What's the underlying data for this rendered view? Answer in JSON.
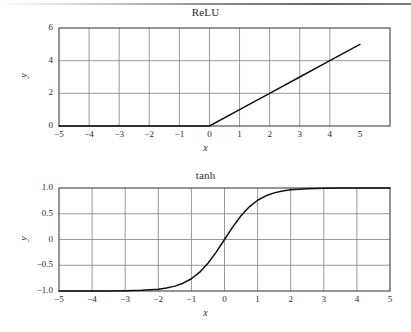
{
  "page": {
    "background_color": "#ffffff",
    "ink_color": "#1a1a1a",
    "grid_color": "#808080",
    "axis_color": "#404040",
    "curve_color": "#111111"
  },
  "chart_data": [
    {
      "id": "relu",
      "type": "line",
      "title": "ReLU",
      "xlabel": "x",
      "ylabel": "y",
      "xlim": [
        -5,
        6
      ],
      "ylim": [
        0,
        6
      ],
      "xticks": [
        -5,
        -4,
        -3,
        -2,
        -1,
        0,
        1,
        2,
        3,
        4,
        5
      ],
      "xticklabels": [
        "−5",
        "−4",
        "−3",
        "−2",
        "−1",
        "0",
        "1",
        "2",
        "3",
        "4",
        "5"
      ],
      "yticks": [
        0,
        2,
        4,
        6
      ],
      "yticklabels": [
        "0",
        "2",
        "4",
        "6"
      ],
      "grid": true,
      "grid_x": [
        -4,
        -3,
        -2,
        -1,
        0,
        1,
        2,
        3,
        4
      ],
      "grid_y": [
        2,
        4
      ],
      "legend": null,
      "x": [
        -5,
        -4,
        -3,
        -2,
        -1,
        0,
        1,
        2,
        3,
        4,
        5
      ],
      "y": [
        0,
        0,
        0,
        0,
        0,
        0,
        1,
        2,
        3,
        4,
        5
      ]
    },
    {
      "id": "tanh",
      "type": "line",
      "title": "tanh",
      "xlabel": "x",
      "ylabel": "y",
      "xlim": [
        -5,
        5
      ],
      "ylim": [
        -1.0,
        1.0
      ],
      "xticks": [
        -5,
        -4,
        -3,
        -2,
        -1,
        0,
        1,
        2,
        3,
        4,
        5
      ],
      "xticklabels": [
        "−5",
        "−4",
        "−3",
        "−2",
        "−1",
        "0",
        "1",
        "2",
        "3",
        "4",
        "5"
      ],
      "yticks": [
        -1.0,
        -0.5,
        0,
        0.5,
        1.0
      ],
      "yticklabels": [
        "−1.0",
        "−0.5",
        "0",
        "0.5",
        "1.0"
      ],
      "grid": true,
      "grid_x": [
        -4,
        -3,
        -2,
        -1,
        0,
        1,
        2,
        3,
        4
      ],
      "grid_y": [
        -0.5,
        0,
        0.5
      ],
      "legend": null,
      "x": [
        -5.0,
        -4.5,
        -4.0,
        -3.5,
        -3.0,
        -2.5,
        -2.0,
        -1.75,
        -1.5,
        -1.25,
        -1.0,
        -0.75,
        -0.5,
        -0.25,
        0.0,
        0.25,
        0.5,
        0.75,
        1.0,
        1.25,
        1.5,
        1.75,
        2.0,
        2.5,
        3.0,
        3.5,
        4.0,
        4.5,
        5.0
      ],
      "y": [
        -0.9999,
        -0.9998,
        -0.9993,
        -0.9982,
        -0.9951,
        -0.9866,
        -0.964,
        -0.9414,
        -0.9051,
        -0.8483,
        -0.7616,
        -0.6351,
        -0.4621,
        -0.2449,
        0.0,
        0.2449,
        0.4621,
        0.6351,
        0.7616,
        0.8483,
        0.9051,
        0.9414,
        0.964,
        0.9866,
        0.9951,
        0.9982,
        0.9993,
        0.9998,
        0.9999
      ]
    }
  ]
}
